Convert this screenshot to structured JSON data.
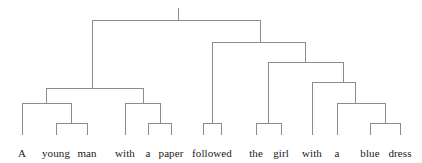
{
  "figure": {
    "name": "constituency-parse-tree",
    "sentence": "A young man with a paper followed the girl with a blue dress",
    "background_color": "#ffffff",
    "line_color": "#8c8c8c",
    "text_color": "#1a1a1a",
    "line_width": 1,
    "width": 422,
    "height": 163
  },
  "leaves": [
    {
      "id": "w1",
      "label": "A",
      "x": 22,
      "y": 147
    },
    {
      "id": "w2",
      "label": "young",
      "x": 56,
      "y": 147
    },
    {
      "id": "w3",
      "label": "man",
      "x": 87,
      "y": 147
    },
    {
      "id": "w4",
      "label": "with",
      "x": 125,
      "y": 147
    },
    {
      "id": "w5",
      "label": "a",
      "x": 148,
      "y": 147
    },
    {
      "id": "w6",
      "label": "paper",
      "x": 171,
      "y": 147
    },
    {
      "id": "w7",
      "label": "followed",
      "x": 212,
      "y": 147
    },
    {
      "id": "w8",
      "label": "the",
      "x": 256,
      "y": 147
    },
    {
      "id": "w9",
      "label": "girl",
      "x": 281,
      "y": 147
    },
    {
      "id": "w10",
      "label": "with",
      "x": 312,
      "y": 147
    },
    {
      "id": "w11",
      "label": "a",
      "x": 337,
      "y": 147
    },
    {
      "id": "w12",
      "label": "blue",
      "x": 370,
      "y": 147
    },
    {
      "id": "w13",
      "label": "dress",
      "x": 400,
      "y": 147
    }
  ],
  "root_stub": {
    "x": 178,
    "y_top": 8,
    "y_bottom": 20
  },
  "brackets": [
    {
      "id": "root",
      "name": "root-bracket",
      "y": 20,
      "left_x": 92,
      "right_x": 260,
      "left_drop": 88,
      "right_drop": 42
    },
    {
      "id": "np-subj",
      "name": "np-subject-bracket",
      "y": 88,
      "left_x": 46,
      "right_x": 143,
      "left_drop": 103,
      "right_drop": 103
    },
    {
      "id": "np-core",
      "name": "np-core-bracket",
      "y": 103,
      "left_x": 22,
      "right_x": 71,
      "left_drop": 135,
      "right_drop": 123
    },
    {
      "id": "nbar-left",
      "name": "young-man-bracket",
      "y": 123,
      "left_x": 56,
      "right_x": 87,
      "left_drop": 135,
      "right_drop": 135
    },
    {
      "id": "pp-paper",
      "name": "pp-with-paper-bracket",
      "y": 103,
      "left_x": 125,
      "right_x": 160,
      "left_drop": 135,
      "right_drop": 123
    },
    {
      "id": "np-paper",
      "name": "a-paper-bracket",
      "y": 123,
      "left_x": 148,
      "right_x": 171,
      "left_drop": 135,
      "right_drop": 135
    },
    {
      "id": "vp",
      "name": "vp-bracket",
      "y": 42,
      "left_x": 212,
      "right_x": 305,
      "left_drop": 123,
      "right_drop": 62
    },
    {
      "id": "v-stub",
      "name": "followed-stub-bracket",
      "y": 123,
      "left_x": 203,
      "right_x": 221,
      "left_drop": 135,
      "right_drop": 135
    },
    {
      "id": "np-obj",
      "name": "np-object-bracket",
      "y": 62,
      "left_x": 268,
      "right_x": 343,
      "left_drop": 123,
      "right_drop": 82
    },
    {
      "id": "np-girl",
      "name": "the-girl-bracket",
      "y": 123,
      "left_x": 256,
      "right_x": 281,
      "left_drop": 135,
      "right_drop": 135
    },
    {
      "id": "pp-dress",
      "name": "pp-with-dress-bracket",
      "y": 82,
      "left_x": 312,
      "right_x": 355,
      "left_drop": 135,
      "right_drop": 103
    },
    {
      "id": "np-dress",
      "name": "np-blue-dress-bracket",
      "y": 103,
      "left_x": 337,
      "right_x": 385,
      "left_drop": 135,
      "right_drop": 123
    },
    {
      "id": "nbar-dress",
      "name": "blue-dress-bracket",
      "y": 123,
      "left_x": 370,
      "right_x": 400,
      "left_drop": 135,
      "right_drop": 135
    }
  ]
}
